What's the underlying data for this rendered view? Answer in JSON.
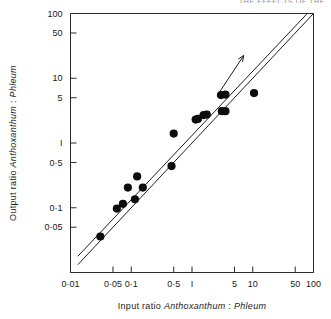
{
  "running_head": "THE EFFECTS OF THE",
  "chart_data": {
    "type": "scatter",
    "title": "",
    "xlabel_parts": {
      "prefix": "Input  ratio ",
      "species_a": "Anthoxanthum",
      "separator": " : ",
      "species_b": "Phleum"
    },
    "ylabel_parts": {
      "prefix": "Output  ratio ",
      "species_a": "Anthoxanthum",
      "separator": " : ",
      "species_b": "Phleum"
    },
    "xlabel": "Input ratio Anthoxanthum : Phleum",
    "ylabel": "Output ratio Anthoxanthum : Phleum",
    "xscale": "log",
    "yscale": "log",
    "xlim": [
      0.01,
      100
    ],
    "ylim": [
      0.01,
      100
    ],
    "grid": false,
    "legend": null,
    "xticks": [
      0.01,
      0.05,
      0.1,
      0.5,
      1,
      5,
      10,
      50,
      100
    ],
    "xtick_labels": [
      "0·01",
      "0·05",
      "0·1",
      "0·5",
      "I",
      "5",
      "10",
      "50",
      "100"
    ],
    "yticks": [
      0.05,
      0.1,
      0.5,
      1,
      5,
      10,
      50,
      100
    ],
    "ytick_labels": [
      "0·05",
      "0·1",
      "0·5",
      "I",
      "5",
      "10",
      "50",
      "100"
    ],
    "points": [
      {
        "x": 0.031,
        "y": 0.036
      },
      {
        "x": 0.058,
        "y": 0.097
      },
      {
        "x": 0.073,
        "y": 0.115
      },
      {
        "x": 0.088,
        "y": 0.205
      },
      {
        "x": 0.115,
        "y": 0.135
      },
      {
        "x": 0.125,
        "y": 0.305
      },
      {
        "x": 0.155,
        "y": 0.205
      },
      {
        "x": 0.46,
        "y": 0.44
      },
      {
        "x": 0.5,
        "y": 1.4
      },
      {
        "x": 1.15,
        "y": 2.3
      },
      {
        "x": 1.25,
        "y": 2.35
      },
      {
        "x": 1.55,
        "y": 2.7
      },
      {
        "x": 1.75,
        "y": 2.75
      },
      {
        "x": 3.0,
        "y": 5.5
      },
      {
        "x": 3.1,
        "y": 3.1
      },
      {
        "x": 3.55,
        "y": 5.6
      },
      {
        "x": 3.55,
        "y": 3.1
      },
      {
        "x": 10.5,
        "y": 5.9
      }
    ],
    "reference_lines": [
      {
        "name": "one-to-one-line",
        "from": [
          0.0132,
          0.0132
        ],
        "to": [
          100,
          100
        ]
      },
      {
        "name": "offset-line",
        "from": [
          0.0132,
          0.0178
        ],
        "to": [
          79,
          100
        ]
      }
    ],
    "annotations": [
      {
        "name": "trend-arrow",
        "from": [
          2.9,
          6.3
        ],
        "to": [
          7.1,
          22.5
        ],
        "style": "arrow"
      }
    ],
    "point_count": 18
  }
}
